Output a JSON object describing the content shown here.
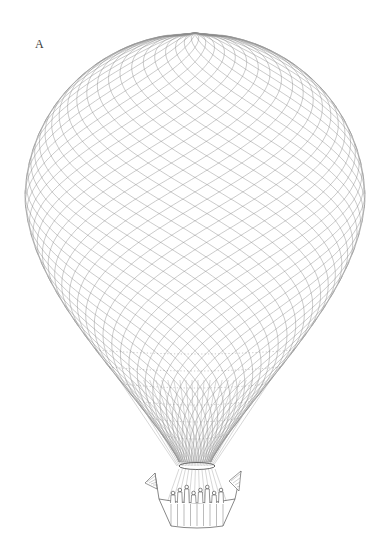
{
  "figure": {
    "label": "A",
    "ink_color": "#555555",
    "line_color_light": "#9a9a9a",
    "background": "#ffffff"
  },
  "balloon": {
    "center_x": 195,
    "top_y": 33,
    "equator_y": 200,
    "radius_x": 170,
    "radius_top": 167,
    "neck_y": 462,
    "neck_half_width": 16,
    "net_meridians": 44,
    "net_rows": 34
  },
  "gondola": {
    "center_x": 197,
    "rim_y": 503,
    "bottom_y": 526,
    "half_width": 30,
    "flags": [
      "left-flag",
      "right-flag"
    ],
    "figures_count": 8
  }
}
